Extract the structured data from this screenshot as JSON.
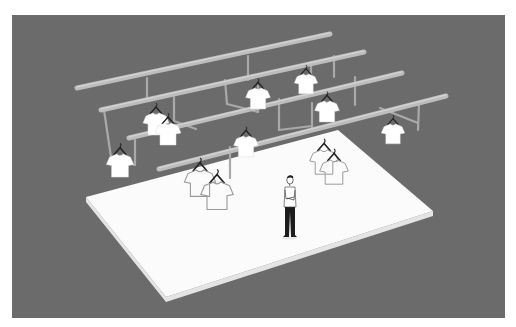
{
  "scene": {
    "caption": "Isometric illustration: a man standing on a white platform beneath overhead clothing rails with hanging T-shirts",
    "colors": {
      "page": "#ffffff",
      "background": "#6b6b6b",
      "platform_top": "#fbfbfb",
      "platform_edge": "#e4e4e4",
      "rail": "#bdbdbd",
      "rail_highlight": "#d4d4d4",
      "support": "#a9a9a9",
      "shirt_fill": "#ffffff",
      "shirt_outline": "#9a9a9a",
      "hanger": "#222222",
      "person_pants": "#1c1c1c",
      "person_shirt": "#ffffff",
      "person_outline": "#333333"
    },
    "panel": {
      "x": 12,
      "y": 15,
      "w": 493,
      "h": 303
    },
    "platform": {
      "top": [
        [
          86,
          197
        ],
        [
          338,
          130
        ],
        [
          433,
          211
        ],
        [
          166,
          297
        ]
      ],
      "thickness": 5
    },
    "rails": [
      {
        "x1": 77,
        "y1": 88,
        "x2": 330,
        "y2": 34
      },
      {
        "x1": 101,
        "y1": 110,
        "x2": 364,
        "y2": 52
      },
      {
        "x1": 129,
        "y1": 138,
        "x2": 402,
        "y2": 73
      },
      {
        "x1": 159,
        "y1": 169,
        "x2": 446,
        "y2": 96
      }
    ],
    "supports": [
      {
        "x1": 147,
        "y1": 78,
        "x2": 147,
        "y2": 100
      },
      {
        "x1": 104,
        "y1": 110,
        "x2": 111,
        "y2": 157
      },
      {
        "x1": 111,
        "y1": 157,
        "x2": 135,
        "y2": 165
      },
      {
        "x1": 174,
        "y1": 97,
        "x2": 174,
        "y2": 121
      },
      {
        "x1": 174,
        "y1": 121,
        "x2": 196,
        "y2": 129
      },
      {
        "x1": 135,
        "y1": 140,
        "x2": 135,
        "y2": 165
      },
      {
        "x1": 248,
        "y1": 56,
        "x2": 248,
        "y2": 80
      },
      {
        "x1": 225,
        "y1": 80,
        "x2": 227,
        "y2": 104
      },
      {
        "x1": 227,
        "y1": 104,
        "x2": 258,
        "y2": 112
      },
      {
        "x1": 258,
        "y1": 86,
        "x2": 258,
        "y2": 112
      },
      {
        "x1": 311,
        "y1": 62,
        "x2": 311,
        "y2": 88
      },
      {
        "x1": 334,
        "y1": 56,
        "x2": 334,
        "y2": 77
      },
      {
        "x1": 279,
        "y1": 99,
        "x2": 279,
        "y2": 130
      },
      {
        "x1": 279,
        "y1": 130,
        "x2": 312,
        "y2": 126
      },
      {
        "x1": 355,
        "y1": 77,
        "x2": 355,
        "y2": 105
      },
      {
        "x1": 312,
        "y1": 103,
        "x2": 312,
        "y2": 128
      },
      {
        "x1": 230,
        "y1": 147,
        "x2": 230,
        "y2": 178
      },
      {
        "x1": 380,
        "y1": 108,
        "x2": 418,
        "y2": 123
      },
      {
        "x1": 419,
        "y1": 103,
        "x2": 418,
        "y2": 130
      }
    ],
    "shirts": [
      {
        "x": 156,
        "y": 113,
        "s": 1.0,
        "style": "filled"
      },
      {
        "x": 168,
        "y": 123,
        "s": 1.0,
        "style": "filled"
      },
      {
        "x": 120,
        "y": 154,
        "s": 1.05,
        "style": "filled"
      },
      {
        "x": 258,
        "y": 88,
        "s": 0.95,
        "style": "filled"
      },
      {
        "x": 306,
        "y": 74,
        "s": 0.9,
        "style": "filled"
      },
      {
        "x": 327,
        "y": 101,
        "s": 0.95,
        "style": "filled"
      },
      {
        "x": 246,
        "y": 136,
        "s": 0.95,
        "style": "filled"
      },
      {
        "x": 393,
        "y": 124,
        "s": 0.9,
        "style": "filled"
      },
      {
        "x": 200,
        "y": 170,
        "s": 1.2,
        "style": "outline"
      },
      {
        "x": 217,
        "y": 182,
        "s": 1.25,
        "style": "outline"
      },
      {
        "x": 324,
        "y": 150,
        "s": 1.1,
        "style": "outline"
      },
      {
        "x": 334,
        "y": 160,
        "s": 1.1,
        "style": "outline"
      }
    ],
    "person": {
      "x": 290,
      "y": 178,
      "height": 62
    }
  }
}
